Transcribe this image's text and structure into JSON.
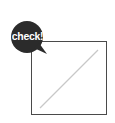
{
  "badge": {
    "label": "check!",
    "background_color": "#2b2b2b",
    "text_color": "#ffffff"
  },
  "placeholder": {
    "icon": "image-placeholder-icon",
    "border_color": "#4a4a4a",
    "line_color": "#c8c8c8"
  }
}
